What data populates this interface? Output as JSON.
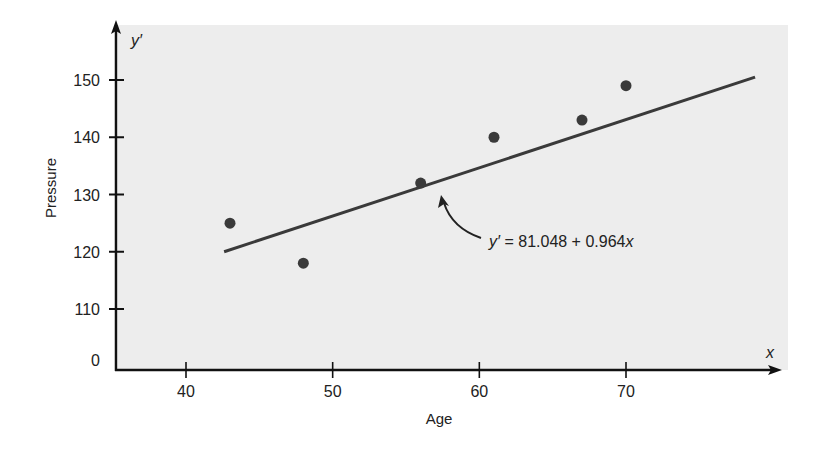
{
  "chart_data": {
    "type": "scatter",
    "title": "",
    "xlabel": "Age",
    "ylabel": "Pressure",
    "x_axis_variable": "x",
    "y_axis_variable": "y′",
    "xlim": [
      35,
      79
    ],
    "ylim": [
      0,
      155
    ],
    "y_axis_break": true,
    "x_ticks": [
      40,
      50,
      60,
      70
    ],
    "y_ticks": [
      0,
      110,
      120,
      130,
      140,
      150
    ],
    "grid": false,
    "legend": null,
    "series": [
      {
        "name": "Observed data",
        "type": "scatter",
        "points": [
          {
            "x": 43,
            "y": 125
          },
          {
            "x": 48,
            "y": 118
          },
          {
            "x": 56,
            "y": 132
          },
          {
            "x": 61,
            "y": 140
          },
          {
            "x": 67,
            "y": 143
          },
          {
            "x": 70,
            "y": 149
          }
        ]
      },
      {
        "name": "Regression line",
        "type": "line",
        "equation": "y′ = 81.048 + 0.964x",
        "intercept": 81.048,
        "slope": 0.964,
        "points": [
          {
            "x": 42.6,
            "y": 120
          },
          {
            "x": 78.8,
            "y": 150.5
          }
        ]
      }
    ],
    "annotations": [
      {
        "text": "y′ = 81.048 + 0.964x",
        "arrow_to": "regression-line",
        "position": "below-right of line near x=57"
      }
    ]
  },
  "labels": {
    "y_var": "y′",
    "x_var": "x",
    "ylabel": "Pressure",
    "xlabel": "Age",
    "equation_y": "y′",
    "equation_rest": " = 81.048 + 0.964",
    "equation_x": "x"
  },
  "colors": {
    "plot_background": "#ededed",
    "axis": "#111111",
    "point": "#3a3a3a",
    "line": "#3a3a3a",
    "text": "#222222"
  }
}
